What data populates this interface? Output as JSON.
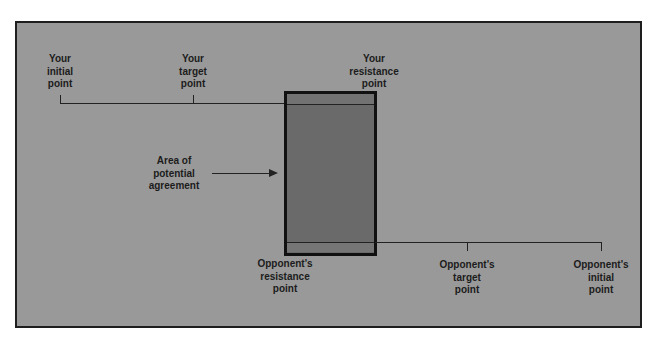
{
  "diagram": {
    "your_side": {
      "initial_point": "Your\ninitial\npoint",
      "target_point": "Your\ntarget\npoint",
      "resistance_point": "Your\nresistance\npoint"
    },
    "opponent_side": {
      "resistance_point": "Opponent's\nresistance\npoint",
      "target_point": "Opponent's\ntarget\npoint",
      "initial_point": "Opponent's\ninitial\npoint"
    },
    "zopa_label": "Area of\npotential\nagreement",
    "colors": {
      "background": "#999999",
      "zopa_fill": "#6a6a6a",
      "lines": "#222222",
      "text": "#1c1c1c"
    }
  }
}
